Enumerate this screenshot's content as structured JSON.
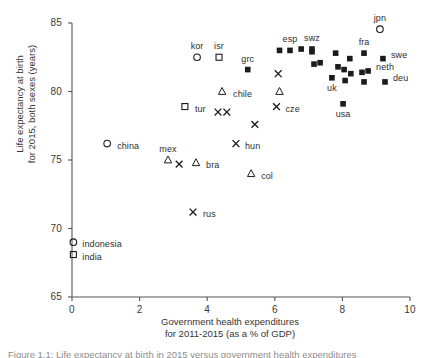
{
  "figure": {
    "caption": "Figure 1.1: Life expectancy at birth in 2015 versus government health expenditures"
  },
  "chart_data": {
    "type": "scatter",
    "title": "",
    "xlabel": "Government health expenditures for 2011-2015 (as a % of GDP)",
    "xlabel_lines": [
      "Government health expenditures",
      "for 2011-2015 (as a % of GDP)"
    ],
    "ylabel": "Life expectancy at birth for 2015, both sexes (years)",
    "ylabel_lines": [
      "Life expectancy at birth",
      "for 2015, both sexes (years)"
    ],
    "xlim": [
      0,
      10
    ],
    "ylim": [
      65,
      85
    ],
    "xticks": [
      0,
      2,
      4,
      6,
      8,
      10
    ],
    "yticks": [
      65,
      70,
      75,
      80,
      85
    ],
    "xtick_labels": [
      "0",
      "2",
      "4",
      "6",
      "8",
      "10"
    ],
    "ytick_labels": [
      "65",
      "70",
      "75",
      "80",
      "85"
    ],
    "grid": false,
    "legend": null,
    "marker_shapes": [
      "circle-open",
      "square-open",
      "square-filled",
      "triangle-open",
      "cross"
    ],
    "points": [
      {
        "label": "jpn",
        "x": 9.11,
        "y": 84.55,
        "marker": "circle-open",
        "label_dx": 0,
        "label_dy": -10
      },
      {
        "label": "kor",
        "x": 3.7,
        "y": 82.5,
        "marker": "circle-open",
        "label_dx": 0,
        "label_dy": -10
      },
      {
        "label": "isr",
        "x": 4.35,
        "y": 82.5,
        "marker": "square-open",
        "label_dx": 0,
        "label_dy": -10
      },
      {
        "label": "esp",
        "x": 6.45,
        "y": 83.0,
        "marker": "square-filled",
        "label_dx": 0,
        "label_dy": -10
      },
      {
        "label": "swz",
        "x": 7.1,
        "y": 83.1,
        "marker": "square-filled",
        "label_dx": 0,
        "label_dy": -10
      },
      {
        "label": "fra",
        "x": 8.64,
        "y": 82.8,
        "marker": "square-filled",
        "label_dx": 0,
        "label_dy": -10
      },
      {
        "label": "swe",
        "x": 9.2,
        "y": 82.4,
        "marker": "square-filled",
        "label_dx": 8,
        "label_dy": -3
      },
      {
        "label": "neth",
        "x": 8.76,
        "y": 81.5,
        "marker": "square-filled",
        "label_dx": 8,
        "label_dy": -3
      },
      {
        "label": "deu",
        "x": 9.26,
        "y": 80.7,
        "marker": "square-filled",
        "label_dx": 8,
        "label_dy": -3
      },
      {
        "label": "grc",
        "x": 5.2,
        "y": 81.6,
        "marker": "square-filled",
        "label_dx": 0,
        "label_dy": -10
      },
      {
        "label": "uk",
        "x": 7.69,
        "y": 81.0,
        "marker": "square-filled",
        "label_dx": 0,
        "label_dy": 11
      },
      {
        "label": "usa",
        "x": 8.02,
        "y": 79.1,
        "marker": "square-filled",
        "label_dx": 0,
        "label_dy": 11
      },
      {
        "label": "cze",
        "x": 6.05,
        "y": 78.9,
        "marker": "cross",
        "label_dx": 9,
        "label_dy": 3
      },
      {
        "label": "chile",
        "x": 4.44,
        "y": 80.0,
        "marker": "triangle-open",
        "label_dx": 11,
        "label_dy": 3
      },
      {
        "label": "tur",
        "x": 3.34,
        "y": 78.9,
        "marker": "square-open",
        "label_dx": 10,
        "label_dy": 3
      },
      {
        "label": "hun",
        "x": 4.85,
        "y": 76.2,
        "marker": "cross",
        "label_dx": 9,
        "label_dy": 3
      },
      {
        "label": "china",
        "x": 1.04,
        "y": 76.2,
        "marker": "circle-open",
        "label_dx": 10,
        "label_dy": 3
      },
      {
        "label": "mex",
        "x": 2.84,
        "y": 75.0,
        "marker": "triangle-open",
        "label_dx": 0,
        "label_dy": -10
      },
      {
        "label": "bra",
        "x": 3.67,
        "y": 74.8,
        "marker": "triangle-open",
        "label_dx": 10,
        "label_dy": 3
      },
      {
        "label": "col",
        "x": 5.3,
        "y": 74.0,
        "marker": "triangle-open",
        "label_dx": 10,
        "label_dy": 3
      },
      {
        "label": "rus",
        "x": 3.58,
        "y": 71.2,
        "marker": "cross",
        "label_dx": 10,
        "label_dy": 3
      },
      {
        "label": "indonesia",
        "x": 0.04,
        "y": 69.0,
        "marker": "circle-open",
        "label_dx": 9,
        "label_dy": 3
      },
      {
        "label": "india",
        "x": 0.04,
        "y": 68.1,
        "marker": "square-open",
        "label_dx": 9,
        "label_dy": 3
      },
      {
        "label": "",
        "x": 6.14,
        "y": 83.0,
        "marker": "square-filled"
      },
      {
        "label": "",
        "x": 6.78,
        "y": 83.1,
        "marker": "square-filled"
      },
      {
        "label": "",
        "x": 7.1,
        "y": 82.9,
        "marker": "square-filled"
      },
      {
        "label": "",
        "x": 7.8,
        "y": 82.8,
        "marker": "square-filled"
      },
      {
        "label": "",
        "x": 8.22,
        "y": 82.4,
        "marker": "square-filled"
      },
      {
        "label": "",
        "x": 7.16,
        "y": 82.0,
        "marker": "square-filled"
      },
      {
        "label": "",
        "x": 7.34,
        "y": 82.1,
        "marker": "square-filled"
      },
      {
        "label": "",
        "x": 7.87,
        "y": 81.8,
        "marker": "square-filled"
      },
      {
        "label": "",
        "x": 8.05,
        "y": 81.6,
        "marker": "square-filled"
      },
      {
        "label": "",
        "x": 8.25,
        "y": 81.3,
        "marker": "square-filled"
      },
      {
        "label": "",
        "x": 8.58,
        "y": 81.4,
        "marker": "square-filled"
      },
      {
        "label": "",
        "x": 8.08,
        "y": 80.8,
        "marker": "square-filled"
      },
      {
        "label": "",
        "x": 8.64,
        "y": 80.7,
        "marker": "square-filled"
      },
      {
        "label": "",
        "x": 6.1,
        "y": 81.3,
        "marker": "cross"
      },
      {
        "label": "",
        "x": 6.14,
        "y": 80.0,
        "marker": "triangle-open"
      },
      {
        "label": "",
        "x": 4.32,
        "y": 78.5,
        "marker": "cross"
      },
      {
        "label": "",
        "x": 4.58,
        "y": 78.5,
        "marker": "cross"
      },
      {
        "label": "",
        "x": 5.41,
        "y": 77.6,
        "marker": "cross"
      },
      {
        "label": "",
        "x": 3.17,
        "y": 74.7,
        "marker": "cross"
      }
    ]
  }
}
